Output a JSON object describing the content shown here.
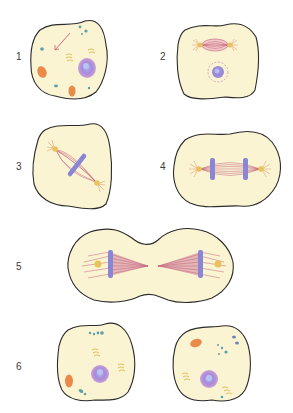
{
  "figure": {
    "colors": {
      "cytoplasm": "#fbf4d3",
      "membrane": "#2b2b2b",
      "chromatin": "#9b7fd0",
      "chromosome": "#8a86d6",
      "spindle": "#c0607a",
      "centrosome": "#e8c35a",
      "mitochondria": "#ea8a4a",
      "vesicle": "#5f9fa8",
      "golgi": "#e2c36a",
      "nuclear_envelope": "#c9a0d0"
    },
    "stages": [
      {
        "label": "1",
        "description": "Interphase cell with nucleus, mitochondria, Golgi and centrioles"
      },
      {
        "label": "2",
        "description": "Prophase: spindle forming, nuclear envelope dissolving"
      },
      {
        "label": "3",
        "description": "Metaphase: chromosomes aligned at the metaphase plate"
      },
      {
        "label": "4",
        "description": "Anaphase: sister chromatids separating toward poles"
      },
      {
        "label": "5",
        "description": "Telophase: cleavage furrow forming"
      },
      {
        "label": "6",
        "description": "Two daughter cells in interphase"
      }
    ]
  }
}
